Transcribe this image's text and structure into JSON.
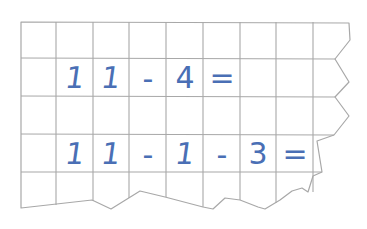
{
  "worksheet": {
    "grid_color": "#a8a8a8",
    "ink_color": "#4a6fb5",
    "rows": [
      {
        "label": "row-1",
        "cells": [
          "",
          "",
          "",
          "",
          "",
          "",
          "",
          "",
          ""
        ]
      },
      {
        "label": "row-2",
        "cells": [
          "",
          "1",
          "1",
          "-",
          "4",
          "=",
          "",
          "",
          ""
        ],
        "expression": "11 - 4 ="
      },
      {
        "label": "row-3",
        "cells": [
          "",
          "",
          "",
          "",
          "",
          "",
          "",
          "",
          ""
        ]
      },
      {
        "label": "row-4",
        "cells": [
          "",
          "1",
          "1",
          "-",
          "1",
          "-",
          "3",
          "=",
          ""
        ],
        "expression": "11 - 1 - 3 ="
      },
      {
        "label": "row-5",
        "cells": [
          "",
          "",
          "",
          "",
          "",
          "",
          "",
          "",
          ""
        ]
      }
    ]
  }
}
